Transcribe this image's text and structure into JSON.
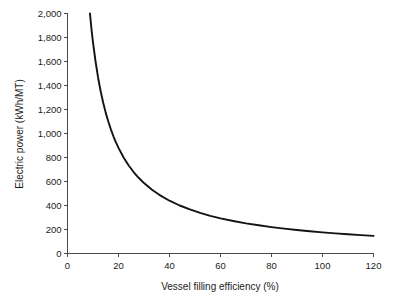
{
  "chart_data": {
    "type": "line",
    "title": "",
    "xlabel": "Vessel filling efficiency (%)",
    "ylabel": "Electric power (kWh/MT)",
    "xlim": [
      0,
      120
    ],
    "ylim": [
      0,
      2000
    ],
    "grid": false,
    "legend": "none",
    "xticks": [
      "0",
      "20",
      "40",
      "60",
      "80",
      "100",
      "120"
    ],
    "xtick_values": [
      0,
      20,
      40,
      60,
      80,
      100,
      120
    ],
    "yticks": [
      "0",
      "200",
      "400",
      "600",
      "800",
      "1,000",
      "1,200",
      "1,400",
      "1,600",
      "1,800",
      "2,000"
    ],
    "ytick_values": [
      0,
      200,
      400,
      600,
      800,
      1000,
      1200,
      1400,
      1600,
      1800,
      2000
    ],
    "series": [
      {
        "name": "Electric power",
        "color": "#121212",
        "x": [
          8.8,
          9.5,
          10,
          11,
          12,
          13,
          14,
          15,
          16,
          17,
          18,
          19,
          20,
          22,
          24,
          26,
          28,
          30,
          33,
          36,
          40,
          44,
          48,
          52,
          56,
          60,
          65,
          70,
          75,
          80,
          85,
          90,
          95,
          100,
          105,
          110,
          115,
          120
        ],
        "y": [
          2000,
          1850,
          1760,
          1600,
          1465,
          1352,
          1256,
          1172,
          1100,
          1035,
          977,
          926,
          880,
          800,
          733,
          677,
          629,
          587,
          533,
          489,
          440,
          400,
          367,
          338,
          314,
          293,
          271,
          251,
          235,
          220,
          207,
          196,
          185,
          176,
          168,
          160,
          153,
          147
        ]
      }
    ],
    "formula_note": "y = 17600 / x"
  },
  "axes": {
    "x_axis_name": "x-axis",
    "y_axis_name": "y-axis"
  }
}
